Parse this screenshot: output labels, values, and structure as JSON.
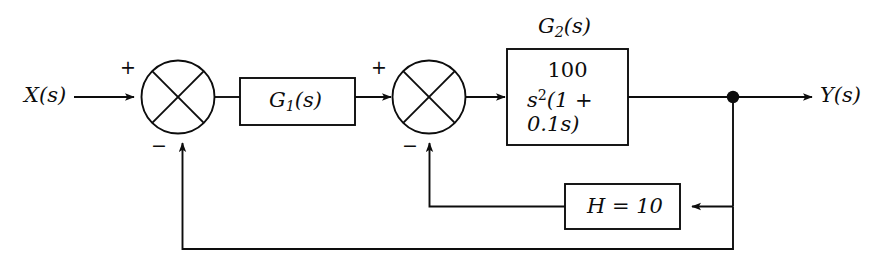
{
  "diagram": {
    "background_color": "#ffffff",
    "line_color": "#0d0d0d",
    "input": {
      "label": "X(s)"
    },
    "output": {
      "label": "Y(s)"
    },
    "summing_junctions": [
      {
        "name": "outer-summing-junction",
        "plus_sign": "+",
        "minus_sign": "−"
      },
      {
        "name": "inner-summing-junction",
        "plus_sign": "+",
        "minus_sign": "−"
      }
    ],
    "blocks": [
      {
        "name": "g1-block",
        "label_base": "G",
        "label_sub": "1",
        "label_tail": "(s)"
      },
      {
        "name": "g2-block",
        "caption_base": "G",
        "caption_sub": "2",
        "caption_tail": "(s)",
        "numerator": "100",
        "denominator_base": "s",
        "denominator_exp": "2",
        "denominator_tail": "(1 + 0.1s)"
      },
      {
        "name": "h-block",
        "label": "H = 10"
      }
    ],
    "nodes": [
      {
        "name": "output-takeoff-node"
      }
    ]
  }
}
